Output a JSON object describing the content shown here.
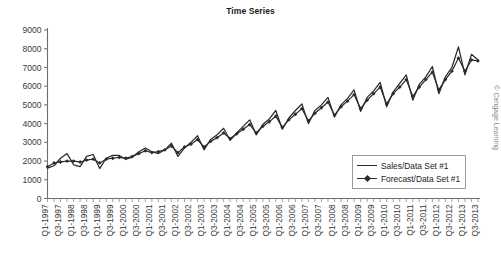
{
  "chart_data": {
    "type": "line",
    "title": "Time Series",
    "xlabel": "",
    "ylabel": "",
    "ylim": [
      0,
      9000
    ],
    "ytick_values": [
      0,
      1000,
      2000,
      3000,
      4000,
      5000,
      6000,
      7000,
      8000,
      9000
    ],
    "ytick_labels": [
      "0",
      "1000",
      "2000",
      "3000",
      "4000",
      "5000",
      "6000",
      "7000",
      "8000",
      "9000"
    ],
    "grid": false,
    "legend_position": "inside-lower-right",
    "categories": [
      "Q1-1997",
      "Q2-1997",
      "Q3-1997",
      "Q4-1997",
      "Q1-1998",
      "Q2-1998",
      "Q3-1998",
      "Q4-1998",
      "Q1-1999",
      "Q2-1999",
      "Q3-1999",
      "Q4-1999",
      "Q1-2000",
      "Q2-2000",
      "Q3-2000",
      "Q4-2000",
      "Q1-2001",
      "Q2-2001",
      "Q3-2001",
      "Q4-2001",
      "Q1-2002",
      "Q2-2002",
      "Q3-2002",
      "Q4-2002",
      "Q1-2003",
      "Q2-2003",
      "Q3-2003",
      "Q4-2003",
      "Q1-2004",
      "Q2-2004",
      "Q3-2004",
      "Q4-2004",
      "Q1-2005",
      "Q2-2005",
      "Q3-2005",
      "Q4-2005",
      "Q1-2006",
      "Q2-2006",
      "Q3-2006",
      "Q4-2006",
      "Q1-2007",
      "Q2-2007",
      "Q3-2007",
      "Q4-2007",
      "Q1-2008",
      "Q2-2008",
      "Q3-2008",
      "Q4-2008",
      "Q1-2009",
      "Q2-2009",
      "Q3-2009",
      "Q4-2009",
      "Q1-2010",
      "Q2-2010",
      "Q3-2010",
      "Q4-2010",
      "Q1-2011",
      "Q2-2011",
      "Q3-2011",
      "Q4-2011",
      "Q1-2012",
      "Q2-2012",
      "Q3-2012",
      "Q4-2012",
      "Q1-2013",
      "Q2-2013",
      "Q3-2013"
    ],
    "xtick_labels": [
      "Q1-1997",
      "Q3-1997",
      "Q1-1998",
      "Q3-1998",
      "Q1-1999",
      "Q3-1999",
      "Q1-2000",
      "Q3-2000",
      "Q1-2001",
      "Q3-2001",
      "Q1-2002",
      "Q3-2002",
      "Q1-2003",
      "Q3-2003",
      "Q1-2004",
      "Q3-2004",
      "Q1-2005",
      "Q3-2005",
      "Q1-2006",
      "Q3-2006",
      "Q1-2007",
      "Q3-2007",
      "Q1-2008",
      "Q3-2008",
      "Q1-2009",
      "Q3-2009",
      "Q1-2010",
      "Q3-2010",
      "Q1-2011",
      "Q3-2011",
      "Q1-2012",
      "Q3-2012",
      "Q1-2013",
      "Q3-2013"
    ],
    "series": [
      {
        "name": "Sales/Data Set #1",
        "marker": "none",
        "color": "#2b2b2b",
        "values": [
          1620,
          1750,
          2150,
          2400,
          1800,
          1700,
          2250,
          2350,
          1600,
          2150,
          2300,
          2300,
          2100,
          2200,
          2500,
          2700,
          2500,
          2400,
          2600,
          2950,
          2250,
          2700,
          3000,
          3350,
          2600,
          3150,
          3400,
          3750,
          3100,
          3500,
          3850,
          4200,
          3400,
          3950,
          4250,
          4700,
          3700,
          4300,
          4700,
          5050,
          4000,
          4700,
          5000,
          5400,
          4350,
          5000,
          5350,
          5800,
          4650,
          5400,
          5750,
          6200,
          4900,
          5700,
          6150,
          6600,
          5250,
          6100,
          6500,
          7050,
          5600,
          6500,
          7000,
          8100,
          6600,
          7700,
          7400
        ]
      },
      {
        "name": "Forecast/Data Set #1",
        "marker": "diamond",
        "color": "#2b2b2b",
        "values": [
          1700,
          1900,
          1950,
          2000,
          2000,
          1950,
          2050,
          2100,
          1900,
          2100,
          2150,
          2200,
          2150,
          2250,
          2400,
          2550,
          2450,
          2500,
          2600,
          2800,
          2450,
          2750,
          2900,
          3150,
          2750,
          3050,
          3250,
          3500,
          3200,
          3450,
          3700,
          3950,
          3500,
          3850,
          4100,
          4400,
          3800,
          4200,
          4500,
          4800,
          4150,
          4550,
          4850,
          5150,
          4450,
          4900,
          5200,
          5550,
          4800,
          5250,
          5600,
          5950,
          5050,
          5600,
          5950,
          6350,
          5450,
          5950,
          6350,
          6750,
          5800,
          6350,
          6800,
          7500,
          6800,
          7400,
          7350
        ]
      }
    ]
  },
  "attribution": "© Cengage Learning"
}
